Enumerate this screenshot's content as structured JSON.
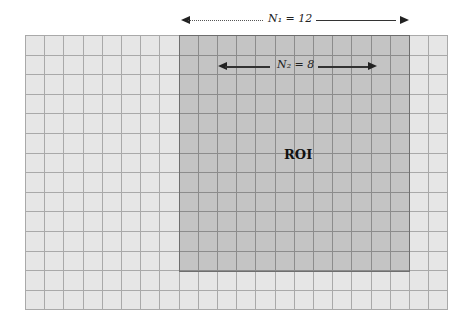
{
  "diagram": {
    "grid": {
      "cols": 22,
      "rows": 14,
      "cell_w": 19.2,
      "cell_h": 19.6
    },
    "roi": {
      "col_start": 8,
      "col_count": 12,
      "row_start": 0,
      "row_count": 12,
      "label": "ROI"
    },
    "dimensions": {
      "outer": {
        "label": "N₁ = 12"
      },
      "inner": {
        "label": "N₂ = 8"
      }
    },
    "colors": {
      "background_cell": "#e6e6e6",
      "roi_cell": "#c4c4c4",
      "grid_line": "#a9a9a9",
      "roi_border": "#6e6e6e"
    }
  }
}
